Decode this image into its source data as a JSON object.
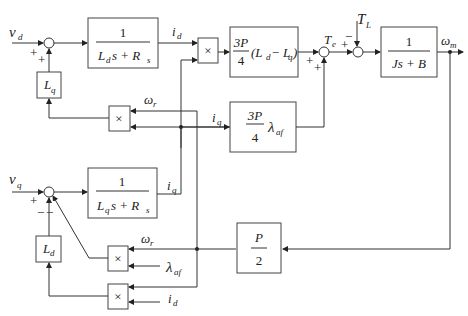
{
  "diagram": {
    "inputs": {
      "vd": {
        "sym": "v",
        "sub": "d"
      },
      "vq": {
        "sym": "v",
        "sub": "q"
      },
      "TL": {
        "sym": "T",
        "sub": "L"
      },
      "lambda_af": {
        "sym": "λ",
        "sub": "af"
      },
      "id_in": {
        "sym": "i",
        "sub": "d"
      }
    },
    "outputs": {
      "wm": {
        "sym": "ω",
        "sub": "m"
      }
    },
    "signals": {
      "id": {
        "sym": "i",
        "sub": "d"
      },
      "iq": {
        "sym": "i",
        "sub": "q"
      },
      "iq2": {
        "sym": "i",
        "sub": "q"
      },
      "wr1": {
        "sym": "ω",
        "sub": "r"
      },
      "wr2": {
        "sym": "ω",
        "sub": "r"
      },
      "Te": {
        "sym": "T",
        "sub": "e"
      }
    },
    "blocks": {
      "d_axis": {
        "num": "1",
        "den_a": "L",
        "den_a_sub": "d",
        "den_b": "s + R",
        "den_b_sub": "s"
      },
      "q_axis": {
        "num": "1",
        "den_a": "L",
        "den_a_sub": "q",
        "den_b": "s + R",
        "den_b_sub": "s"
      },
      "Lq": {
        "sym": "L",
        "sub": "q"
      },
      "Ld": {
        "sym": "L",
        "sub": "d"
      },
      "reluct": {
        "num": "3P",
        "den": "4",
        "expr": "(L",
        "sub1": "d",
        "mid": " − L",
        "sub2": "q",
        "end": ")"
      },
      "magnet": {
        "num": "3P",
        "den": "4",
        "sym": "λ",
        "sub": "af"
      },
      "mech": {
        "num": "1",
        "den": "Js + B"
      },
      "poles": {
        "num": "P",
        "den": "2"
      },
      "mult": "×"
    },
    "signs": {
      "sum_d_top": "+",
      "sum_d_bottom": "+",
      "sum_q_left": "+",
      "sum_q_b1": "−",
      "sum_q_b2": "−",
      "sum_te_left": "+",
      "sum_te_bottom": "+",
      "sum_mech_left": "+",
      "sum_mech_top": "−"
    }
  }
}
